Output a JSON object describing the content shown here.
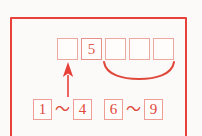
{
  "figure": {
    "frame": {
      "stroke_color": "#e8413a"
    },
    "background_color": "#fbfaf8"
  },
  "answer_row": {
    "name": "answer-boxes",
    "boxes": [
      {
        "value": "",
        "filled": false
      },
      {
        "value": "5",
        "filled": true
      },
      {
        "value": "",
        "filled": false
      },
      {
        "value": "",
        "filled": false
      },
      {
        "value": "",
        "filled": false
      }
    ]
  },
  "brace": {
    "name": "underbrace",
    "spans_boxes": [
      3,
      4,
      5
    ],
    "stroke_color": "#e0483c"
  },
  "arrow": {
    "name": "up-arrow",
    "points_to_box": 1,
    "direction": "up",
    "stroke_color": "#e8413a"
  },
  "ranges": [
    {
      "name": "range-1-4",
      "start": "1",
      "separator": "～",
      "end": "4"
    },
    {
      "name": "range-6-9",
      "start": "6",
      "separator": "～",
      "end": "9"
    }
  ],
  "colors": {
    "frame_red": "#e8413a",
    "box_outline": "#ef9e95",
    "digit_red": "#e0483c",
    "paper": "#fbfaf8"
  }
}
